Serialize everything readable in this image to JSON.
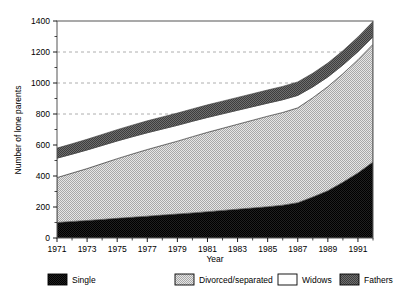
{
  "chart_data": {
    "type": "area",
    "title": "",
    "xlabel": "Year",
    "ylabel": "Number of lone parents",
    "xlim": [
      1971,
      1992
    ],
    "ylim": [
      0,
      1400
    ],
    "ytick_values": [
      0,
      200,
      400,
      600,
      800,
      1000,
      1200,
      1400
    ],
    "ytick_labels": [
      "0",
      "200",
      "400",
      "600",
      "800",
      "1000",
      "1200",
      "1400"
    ],
    "gridlines": {
      "y_dashed_at": [
        800,
        1000,
        1200
      ],
      "x_grid": false
    },
    "xtick_values": [
      1971,
      1973,
      1975,
      1977,
      1979,
      1981,
      1983,
      1985,
      1987,
      1989,
      1991
    ],
    "xtick_labels": [
      "1971",
      "1973",
      "1975",
      "1977",
      "1979",
      "1981",
      "1983",
      "1985",
      "1987",
      "1989",
      "1991"
    ],
    "x": [
      1971,
      1972,
      1973,
      1974,
      1975,
      1976,
      1977,
      1978,
      1979,
      1980,
      1981,
      1982,
      1983,
      1984,
      1985,
      1986,
      1987,
      1988,
      1989,
      1990,
      1991,
      1992
    ],
    "stacked": true,
    "stack_order": [
      "Single",
      "Divorced/separated",
      "Widows",
      "Fathers"
    ],
    "series": [
      {
        "name": "Single",
        "color": "#1a1a1a",
        "pattern": "solid-dark",
        "values": [
          100,
          107,
          113,
          120,
          127,
          134,
          141,
          148,
          155,
          162,
          170,
          178,
          186,
          194,
          202,
          212,
          228,
          265,
          305,
          360,
          420,
          490
        ]
      },
      {
        "name": "Divorced/separated",
        "color": "#c8c8c8",
        "pattern": "light-checker",
        "values": [
          290,
          312,
          335,
          360,
          385,
          408,
          430,
          450,
          470,
          492,
          512,
          530,
          548,
          566,
          584,
          598,
          612,
          640,
          672,
          700,
          730,
          760
        ]
      },
      {
        "name": "Widows",
        "color": "#ffffff",
        "pattern": "white",
        "values": [
          125,
          122,
          120,
          117,
          114,
          111,
          108,
          105,
          102,
          99,
          96,
          93,
          90,
          87,
          84,
          82,
          80,
          70,
          62,
          56,
          52,
          48
        ]
      },
      {
        "name": "Fathers",
        "color": "#5a5a5a",
        "pattern": "dark-checker",
        "values": [
          65,
          67,
          69,
          71,
          73,
          75,
          77,
          78,
          79,
          80,
          81,
          82,
          83,
          84,
          85,
          86,
          87,
          88,
          90,
          92,
          95,
          98
        ]
      }
    ],
    "cumulative_top": [
      580,
      608,
      637,
      668,
      699,
      728,
      756,
      781,
      806,
      833,
      859,
      883,
      907,
      931,
      955,
      978,
      1007,
      1063,
      1129,
      1208,
      1297,
      1396
    ]
  },
  "legend": {
    "position": "below-axes",
    "items": [
      {
        "label": "Single",
        "swatch": "solid-dark"
      },
      {
        "label": "Divorced/separated",
        "swatch": "light-checker"
      },
      {
        "label": "Widows",
        "swatch": "white"
      },
      {
        "label": "Fathers",
        "swatch": "dark-checker"
      }
    ]
  }
}
